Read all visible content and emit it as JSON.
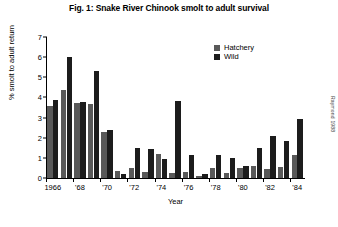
{
  "figure": {
    "title": "Fig. 1: Snake River Chinook smolt to adult survival",
    "credit": "Raymond 1988"
  },
  "legend": {
    "position": "top-right",
    "entries": [
      {
        "label": "Hatchery",
        "color": "#595959"
      },
      {
        "label": "Wild",
        "color": "#1c1c1c"
      }
    ]
  },
  "chart_data": {
    "type": "bar",
    "title": "Fig. 1: Snake River Chinook smolt to adult survival",
    "xlabel": "Year",
    "ylabel": "% smolt to adult return",
    "ylim": [
      0,
      7
    ],
    "yticks": [
      0,
      1,
      2,
      3,
      4,
      5,
      6,
      7
    ],
    "ytick_labels": [
      "0",
      "1",
      "2",
      "3",
      "4",
      "5",
      "6",
      "7"
    ],
    "grid": false,
    "legend_position": "top-right",
    "categories": [
      "1966",
      "1967",
      "1968",
      "1969",
      "1970",
      "1971",
      "1972",
      "1973",
      "1974",
      "1975",
      "1976",
      "1977",
      "1978",
      "1979",
      "1980",
      "1981",
      "1982",
      "1983",
      "1984"
    ],
    "xtick_labels": [
      "1966",
      "'68",
      "'70",
      "'72",
      "'74",
      "'76",
      "'78",
      "'80",
      "'82",
      "'84"
    ],
    "xtick_categories": [
      "1966",
      "1968",
      "1970",
      "1972",
      "1974",
      "1976",
      "1978",
      "1980",
      "1982",
      "1984"
    ],
    "series": [
      {
        "name": "Hatchery",
        "color": "#595959",
        "values": [
          3.6,
          4.35,
          3.7,
          3.65,
          2.3,
          0.35,
          0.5,
          0.3,
          1.2,
          0.25,
          0.3,
          0.1,
          0.5,
          0.25,
          0.5,
          0.6,
          0.45,
          0.55,
          1.15
        ]
      },
      {
        "name": "Wild",
        "color": "#1c1c1c",
        "values": [
          3.85,
          6.0,
          3.75,
          5.3,
          2.4,
          0.2,
          1.5,
          1.45,
          0.95,
          3.8,
          1.15,
          0.2,
          1.15,
          1.0,
          0.6,
          1.5,
          2.1,
          1.85,
          2.95
        ]
      }
    ]
  }
}
